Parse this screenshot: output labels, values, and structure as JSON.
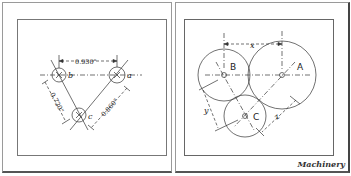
{
  "figure": {
    "credit": "Machinery",
    "left_diagram": {
      "holes": [
        {
          "label": "a"
        },
        {
          "label": "b"
        },
        {
          "label": "c"
        }
      ],
      "dimensions": {
        "a_to_b": "0.930\"",
        "b_to_c": "0.720\"",
        "a_to_c": "0.860\""
      }
    },
    "right_diagram": {
      "gears": [
        {
          "label": "A"
        },
        {
          "label": "B"
        },
        {
          "label": "C"
        }
      ],
      "dimensions": {
        "a_to_b": "x",
        "b_to_c": "y",
        "a_to_c": "z"
      }
    }
  }
}
